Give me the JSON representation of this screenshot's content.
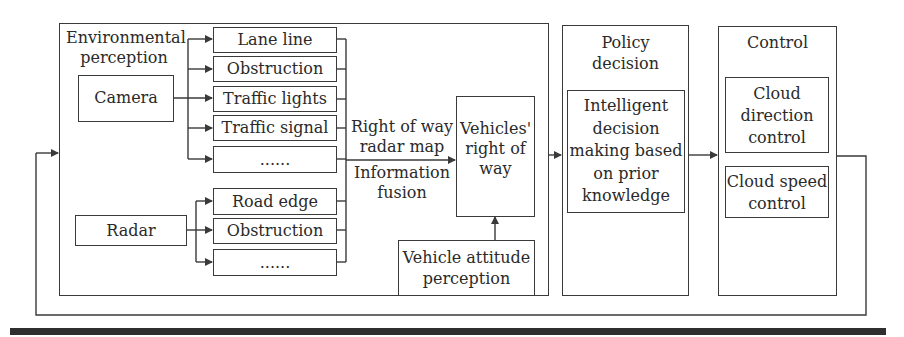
{
  "diagram": {
    "environmental": {
      "title_line1": "Environmental",
      "title_line2": "perception",
      "camera": {
        "label": "Camera",
        "outputs": [
          "Lane line",
          "Obstruction",
          "Traffic lights",
          "Traffic signal",
          "......"
        ]
      },
      "radar": {
        "label": "Radar",
        "outputs": [
          "Road edge",
          "Obstruction",
          "......"
        ]
      },
      "fusion_label_top_1": "Right of way",
      "fusion_label_top_2": "radar map",
      "fusion_label_bottom_1": "Information",
      "fusion_label_bottom_2": "fusion",
      "vehicles_row_1": "Vehicles'",
      "vehicles_row_2": "right of",
      "vehicles_row_3": "way",
      "attitude_1": "Vehicle attitude",
      "attitude_2": "perception"
    },
    "policy": {
      "title_1": "Policy",
      "title_2": "decision",
      "inner_1": "Intelligent",
      "inner_2": "decision",
      "inner_3": "making based",
      "inner_4": "on prior",
      "inner_5": "knowledge"
    },
    "control": {
      "title": "Control",
      "direction_1": "Cloud",
      "direction_2": "direction",
      "direction_3": "control",
      "speed_1": "Cloud speed",
      "speed_2": "control"
    },
    "colors": {
      "line": "#3a3a3a",
      "text": "#2a2a2a",
      "bar": "#2f2f2f"
    }
  }
}
